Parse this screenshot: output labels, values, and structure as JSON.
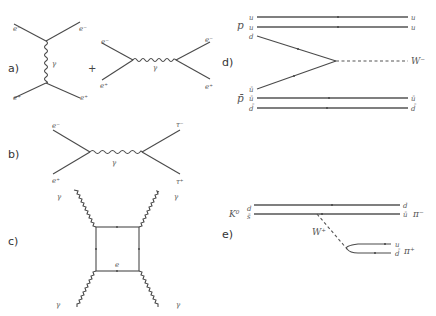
{
  "figure": {
    "panels": [
      {
        "id": "a",
        "label": "a)",
        "plus": "+",
        "diagram1": {
          "top_left": "e⁻",
          "top_right": "e⁻",
          "bottom_left": "e⁺",
          "bottom_right": "e⁺",
          "boson": "γ"
        },
        "diagram2": {
          "top_left": "e⁻",
          "top_right": "e⁻",
          "bottom_left": "e⁺",
          "bottom_right": "e⁺",
          "boson": "γ"
        }
      },
      {
        "id": "b",
        "label": "b)",
        "top_left": "e⁻",
        "bottom_left": "e⁺",
        "top_right": "τ⁻",
        "bottom_right": "τ⁺",
        "boson": "γ"
      },
      {
        "id": "c",
        "label": "c)",
        "photons": [
          "γ",
          "γ",
          "γ",
          "γ"
        ],
        "loop": "e"
      },
      {
        "id": "d",
        "label": "d)",
        "proton": "p",
        "antiproton": "p̄",
        "proton_quarks": [
          "u",
          "u",
          "d"
        ],
        "antiproton_quarks": [
          "ū",
          "ū",
          "d̄"
        ],
        "out_quarks_top": [
          "u",
          "u"
        ],
        "out_quarks_bottom": [
          "ū",
          "d̄"
        ],
        "boson": "W⁻"
      },
      {
        "id": "e",
        "label": "e)",
        "kaon": "K⁰",
        "in_quarks": [
          "d",
          "s̄"
        ],
        "out_quarks_top": [
          "d",
          "ū"
        ],
        "pion_minus": "π⁻",
        "boson": "W⁺",
        "pair_quarks": [
          "u",
          "d̄"
        ],
        "pion_plus": "π⁺"
      }
    ]
  }
}
